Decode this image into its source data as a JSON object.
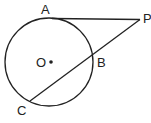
{
  "diagram": {
    "labels": {
      "A": "A",
      "P": "P",
      "O": "O",
      "B": "B",
      "C": "C"
    },
    "stroke_color": "#222222",
    "background": "#ffffff"
  }
}
